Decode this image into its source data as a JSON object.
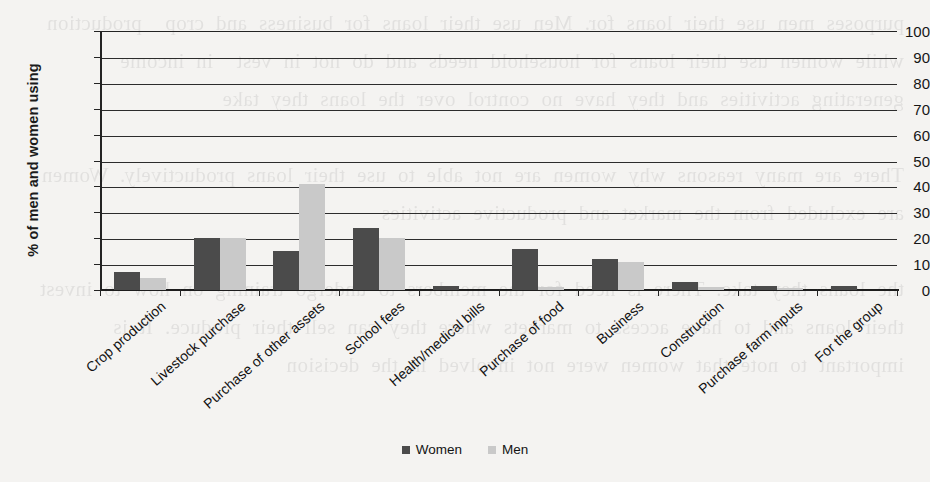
{
  "chart_data": {
    "type": "bar",
    "title": "",
    "subtitle": "",
    "xlabel": "",
    "ylabel": "% of men and women using",
    "ylim": [
      0,
      100
    ],
    "yticks": [
      0,
      10,
      20,
      30,
      40,
      50,
      60,
      70,
      80,
      90,
      100
    ],
    "grid": true,
    "legend_position": "bottom",
    "categories": [
      "Crop production",
      "Livestock purchase",
      "Purchase of other assets",
      "School fees",
      "Health/medical bills",
      "Purchase of food",
      "Business",
      "Construction",
      "Purchase farm inputs",
      "For the group"
    ],
    "series": [
      {
        "name": "Women",
        "color": "#4b4b4b",
        "values": [
          7,
          20,
          15,
          24,
          1.5,
          16,
          12,
          3,
          1.5,
          1.5
        ]
      },
      {
        "name": "Men",
        "color": "#c9c9c9",
        "values": [
          4.5,
          20,
          41,
          20,
          0,
          1,
          11,
          1,
          0.8,
          0
        ]
      }
    ]
  },
  "legend": {
    "items": [
      {
        "label": "Women",
        "color": "#4b4b4b"
      },
      {
        "label": "Men",
        "color": "#c9c9c9"
      }
    ]
  },
  "background": {
    "bleed_text": "purposes men use their loans for. Men use their loans for business and crop  production while women use their loans for household needs and do not in vest  in income generating activities and they have no control over the loans they take\n\nThere are many reasons why women are not able to use their loans productively. Women are excluded from the market and productive activities\n\nthe loans they take. There is need for the members to undergo training on how to invest their loans and to have access to markets where they can sell their produce. It is important to note that women were not involved in the decision"
  }
}
